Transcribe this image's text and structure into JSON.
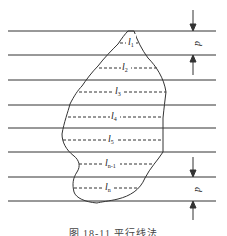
{
  "figure": {
    "caption": "图 18-11  平行线法",
    "spacing_label": "d",
    "segment_labels": [
      {
        "base": "l",
        "sub": "1"
      },
      {
        "base": "l",
        "sub": "2"
      },
      {
        "base": "l",
        "sub": "3"
      },
      {
        "base": "l",
        "sub": "4"
      },
      {
        "base": "l",
        "sub": "5"
      },
      {
        "base": "l",
        "sub": "n-1"
      },
      {
        "base": "l",
        "sub": "n"
      }
    ],
    "line_color": "#333333"
  }
}
